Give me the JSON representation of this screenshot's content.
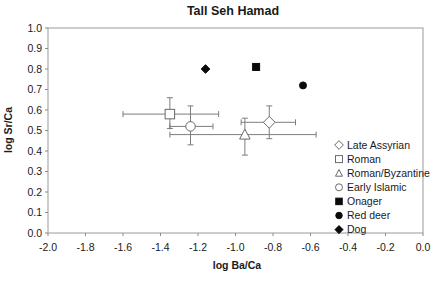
{
  "chart_data": {
    "type": "scatter",
    "title": "Tall Seh Hamad",
    "xlabel": "log Ba/Ca",
    "ylabel": "log Sr/Ca",
    "xlim": [
      -2.0,
      0.0
    ],
    "ylim": [
      0.0,
      1.0
    ],
    "x_ticks": [
      -2.0,
      -1.8,
      -1.6,
      -1.4,
      -1.2,
      -1.0,
      -0.8,
      -0.6,
      -0.4,
      -0.2,
      0.0
    ],
    "y_ticks": [
      0.0,
      0.1,
      0.2,
      0.3,
      0.4,
      0.5,
      0.6,
      0.7,
      0.8,
      0.9,
      1.0
    ],
    "grid": false,
    "legend_position": "inside-right",
    "series": [
      {
        "name": "Late Assyrian",
        "marker": "diamond",
        "filled": false,
        "x": -0.82,
        "y": 0.54,
        "xerr": [
          -0.97,
          -0.68
        ],
        "yerr": [
          0.46,
          0.62
        ]
      },
      {
        "name": "Roman",
        "marker": "square",
        "filled": false,
        "x": -1.35,
        "y": 0.58,
        "xerr": [
          -1.6,
          -1.09
        ],
        "yerr": [
          0.51,
          0.66
        ]
      },
      {
        "name": "Roman/Byzantine",
        "marker": "triangle",
        "filled": false,
        "x": -0.95,
        "y": 0.48,
        "xerr": [
          -1.35,
          -0.57
        ],
        "yerr": [
          0.38,
          0.56
        ]
      },
      {
        "name": "Early Islamic",
        "marker": "circle",
        "filled": false,
        "x": -1.24,
        "y": 0.52,
        "xerr": [
          -1.35,
          -1.12
        ],
        "yerr": [
          0.43,
          0.62
        ]
      },
      {
        "name": "Onager",
        "marker": "square",
        "filled": true,
        "x": -0.89,
        "y": 0.81
      },
      {
        "name": "Red deer",
        "marker": "circle",
        "filled": true,
        "x": -0.64,
        "y": 0.72
      },
      {
        "name": "Dog",
        "marker": "diamond",
        "filled": true,
        "x": -1.16,
        "y": 0.8
      }
    ],
    "colors": {
      "background": "#ffffff",
      "frame": "#9a9a9a",
      "tick": "#8a8a8a",
      "error_bar": "#7d7d7d",
      "open_marker_stroke": "#6a6a6a",
      "open_marker_fill": "#ffffff",
      "filled_marker": "#0a0a0a",
      "text": "#1a1a1a"
    }
  }
}
